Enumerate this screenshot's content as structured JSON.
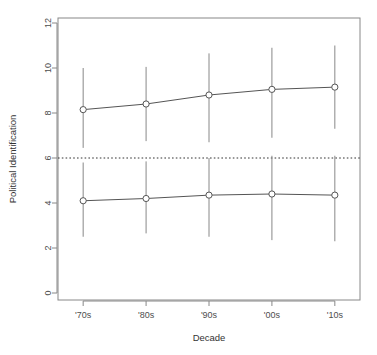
{
  "chart_data": {
    "type": "line",
    "title": "",
    "subtitle": "",
    "xlabel": "Decade",
    "ylabel": "Political Identification",
    "categories": [
      "'70s",
      "'80s",
      "'90s",
      "'00s",
      "'10s"
    ],
    "x_positions": [
      1,
      2,
      3,
      4,
      5
    ],
    "xlim": [
      0.6,
      5.4
    ],
    "ylim": [
      0,
      12
    ],
    "y_ticks": [
      0,
      2,
      4,
      6,
      8,
      10,
      12
    ],
    "y_tick_labels": [
      "0",
      "2",
      "4",
      "6",
      "8",
      "10",
      "12"
    ],
    "grid": false,
    "legend": null,
    "legend_position": "none",
    "point_marker": "open-circle",
    "series": [
      {
        "name": "upper",
        "values": [
          8.15,
          8.4,
          8.8,
          9.05,
          9.15
        ],
        "error_low": [
          6.45,
          6.75,
          6.7,
          6.9,
          7.3
        ],
        "error_high": [
          10.0,
          10.05,
          10.65,
          10.9,
          11.0
        ]
      },
      {
        "name": "lower",
        "values": [
          4.1,
          4.2,
          4.35,
          4.4,
          4.35
        ],
        "error_low": [
          2.5,
          2.65,
          2.5,
          2.35,
          2.3
        ],
        "error_high": [
          5.8,
          5.85,
          6.0,
          6.1,
          6.1
        ]
      }
    ],
    "reference_lines": [
      {
        "name": "midpoint",
        "orientation": "horizontal",
        "value": 6,
        "style": "dotted"
      }
    ],
    "colors": {
      "line": "#555555",
      "marker": "#555555",
      "errorbar": "#888888",
      "reference": "#333333",
      "frame": "#888888",
      "text": "#4d4d4d"
    }
  }
}
